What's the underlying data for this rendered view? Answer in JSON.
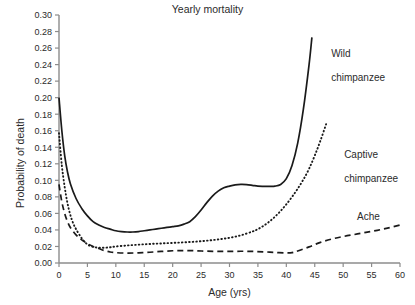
{
  "chart_data": {
    "type": "line",
    "title": "Yearly mortality",
    "xlabel": "Age (yrs)",
    "ylabel": "Probability of death",
    "xlim": [
      0,
      60
    ],
    "ylim": [
      0,
      0.3
    ],
    "grid": false,
    "legend_position": "inline-right",
    "xticks": [
      "0",
      "5",
      "10",
      "15",
      "20",
      "25",
      "30",
      "35",
      "40",
      "45",
      "50",
      "55",
      "60"
    ],
    "xtick_values": [
      0,
      5,
      10,
      15,
      20,
      25,
      30,
      35,
      40,
      45,
      50,
      55,
      60
    ],
    "yticks": [
      "0.00",
      "0.02",
      "0.04",
      "0.06",
      "0.08",
      "0.10",
      "0.12",
      "0.14",
      "0.16",
      "0.18",
      "0.20",
      "0.22",
      "0.24",
      "0.26",
      "0.28",
      "0.30"
    ],
    "ytick_values": [
      0.0,
      0.02,
      0.04,
      0.06,
      0.08,
      0.1,
      0.12,
      0.14,
      0.16,
      0.18,
      0.2,
      0.22,
      0.24,
      0.26,
      0.28,
      0.3
    ],
    "series": [
      {
        "name": "Wild chimpanzee",
        "label_lines": [
          "Wild",
          "chimpanzee"
        ],
        "style": "solid",
        "color": "#1a1a1a",
        "x": [
          0,
          0.5,
          1,
          1.5,
          2,
          3,
          4,
          5,
          6,
          7,
          8,
          9,
          10,
          11,
          12,
          13,
          14,
          15,
          16,
          17,
          18,
          19,
          20,
          21,
          22,
          23,
          24,
          25,
          26,
          27,
          28,
          29,
          30,
          31,
          32,
          33,
          34,
          35,
          36,
          37,
          38,
          39,
          40,
          41,
          42,
          43,
          44,
          44.5
        ],
        "y": [
          0.2,
          0.16,
          0.13,
          0.11,
          0.096,
          0.078,
          0.066,
          0.057,
          0.05,
          0.046,
          0.043,
          0.041,
          0.039,
          0.038,
          0.0375,
          0.0375,
          0.038,
          0.039,
          0.04,
          0.041,
          0.042,
          0.043,
          0.044,
          0.045,
          0.047,
          0.05,
          0.056,
          0.064,
          0.073,
          0.081,
          0.087,
          0.091,
          0.093,
          0.0945,
          0.095,
          0.0948,
          0.094,
          0.093,
          0.0928,
          0.0928,
          0.093,
          0.095,
          0.102,
          0.118,
          0.145,
          0.186,
          0.24,
          0.273
        ]
      },
      {
        "name": "Captive chimpanzee",
        "label_lines": [
          "Captive",
          "chimpanzee"
        ],
        "style": "dotted",
        "color": "#1a1a1a",
        "x": [
          0,
          0.5,
          1,
          1.5,
          2,
          2.5,
          3,
          4,
          5,
          6,
          7,
          8,
          9,
          10,
          12,
          14,
          16,
          18,
          20,
          22,
          24,
          26,
          28,
          30,
          32,
          34,
          35,
          36,
          37,
          38,
          39,
          40,
          41,
          42,
          43,
          44,
          45,
          46,
          47
        ],
        "y": [
          0.157,
          0.118,
          0.092,
          0.072,
          0.058,
          0.048,
          0.041,
          0.03,
          0.0225,
          0.0195,
          0.0185,
          0.0185,
          0.019,
          0.02,
          0.0212,
          0.0222,
          0.023,
          0.0237,
          0.0243,
          0.025,
          0.0258,
          0.027,
          0.0285,
          0.0305,
          0.0335,
          0.038,
          0.041,
          0.045,
          0.05,
          0.056,
          0.063,
          0.071,
          0.08,
          0.09,
          0.101,
          0.114,
          0.13,
          0.148,
          0.168
        ]
      },
      {
        "name": "Ache",
        "label_lines": [
          "Ache"
        ],
        "style": "dashed",
        "color": "#1a1a1a",
        "x": [
          0,
          0.5,
          1,
          1.5,
          2,
          3,
          4,
          5,
          6,
          7,
          8,
          9,
          10,
          12,
          14,
          16,
          18,
          20,
          22,
          24,
          26,
          28,
          30,
          32,
          34,
          36,
          38,
          40,
          41,
          42,
          44,
          46,
          48,
          50,
          52,
          54,
          56,
          58,
          60
        ],
        "y": [
          0.095,
          0.074,
          0.06,
          0.05,
          0.043,
          0.034,
          0.028,
          0.0235,
          0.02,
          0.0175,
          0.015,
          0.0133,
          0.0125,
          0.012,
          0.0123,
          0.013,
          0.014,
          0.0148,
          0.015,
          0.0148,
          0.0143,
          0.014,
          0.014,
          0.0142,
          0.014,
          0.0135,
          0.0128,
          0.0122,
          0.0125,
          0.0145,
          0.0195,
          0.025,
          0.029,
          0.032,
          0.0345,
          0.037,
          0.0395,
          0.0425,
          0.046
        ]
      }
    ]
  },
  "labels": {
    "wild_l1": "Wild",
    "wild_l2": "chimpanzee",
    "captive_l1": "Captive",
    "captive_l2": "chimpanzee",
    "ache": "Ache"
  },
  "colors": {
    "axis": "#8c8c8c",
    "curve": "#1a1a1a",
    "text": "#2b2b2b",
    "background": "#ffffff"
  }
}
